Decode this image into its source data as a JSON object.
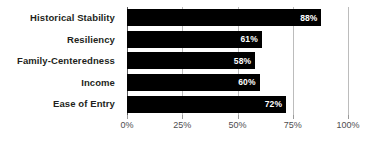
{
  "chart_data": {
    "type": "bar",
    "orientation": "horizontal",
    "title": "",
    "subtitle": "",
    "xlabel": "",
    "ylabel": "",
    "categories": [
      "Historical Stability",
      "Resiliency",
      "Family-Centeredness",
      "Income",
      "Ease of Entry"
    ],
    "values": [
      88,
      61,
      58,
      60,
      72
    ],
    "value_labels": [
      "88%",
      "61%",
      "58%",
      "60%",
      "72%"
    ],
    "series": [
      {
        "name": "",
        "values": [
          88,
          61,
          58,
          60,
          72
        ]
      }
    ],
    "xlim": [
      0,
      100
    ],
    "x_ticks": [
      0,
      25,
      50,
      75,
      100
    ],
    "x_tick_labels": [
      "0%",
      "25%",
      "50%",
      "75%",
      "100%"
    ],
    "grid": true,
    "grid_axis": "x",
    "legend": false,
    "legend_position": "none",
    "annotations": [],
    "colors": {
      "bar": "#000000",
      "value_label": "#ffffff",
      "category_label": "#231f20",
      "tick_label": "#4d4d4f",
      "gridline": "#bcbcbc",
      "axis": "#58585a",
      "background": "#ffffff"
    }
  }
}
